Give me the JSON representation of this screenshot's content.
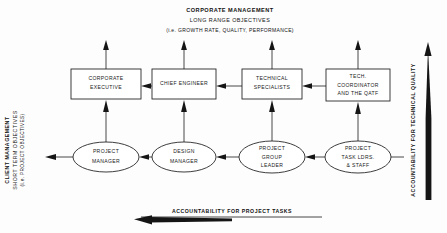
{
  "diagram": {
    "title_block": {
      "line1": "CORPORATE MANAGEMENT",
      "line2": "LONG RANGE OBJECTIVES",
      "line3": "(i.e. GROWTH RATE, QUALITY, PERFORMANCE)"
    },
    "left_axis": {
      "line1": "CLIENT MANAGEMENT",
      "line2": "SHORT TERM OBJECTIVES",
      "line3": "(i.e. PROJECT OBJECTIVES)"
    },
    "right_axis": {
      "label": "ACCOUNTABILITY FOR TECHNICAL QUALITY",
      "arrow_direction": "up"
    },
    "bottom_axis": {
      "label": "ACCOUNTABILITY FOR PROJECT TASKS",
      "arrow_direction": "left"
    },
    "top_row": {
      "shape": "rectangle",
      "nodes": [
        {
          "id": "corporate-executive",
          "lines": [
            "CORPORATE",
            "EXECUTIVE"
          ]
        },
        {
          "id": "chief-engineer",
          "lines": [
            "CHIEF ENGINEER"
          ]
        },
        {
          "id": "technical-specialists",
          "lines": [
            "TECHNICAL",
            "SPECIALISTS"
          ]
        },
        {
          "id": "tech-coordinator",
          "lines": [
            "TECH.",
            "COORDINATOR",
            "AND THE QATF"
          ]
        }
      ]
    },
    "bottom_row": {
      "shape": "ellipse",
      "nodes": [
        {
          "id": "project-manager",
          "lines": [
            "PROJECT",
            "MANAGER"
          ]
        },
        {
          "id": "design-manager",
          "lines": [
            "DESIGN",
            "MANAGER"
          ]
        },
        {
          "id": "project-group-leader",
          "lines": [
            "PROJECT",
            "GROUP",
            "LEADER"
          ]
        },
        {
          "id": "project-task-leaders",
          "lines": [
            "PROJECT",
            "TASK LDRS.",
            "& STAFF"
          ]
        }
      ]
    },
    "colors": {
      "stroke": "#1b1b1b",
      "background": "#fdfdfd",
      "text": "#121212"
    }
  }
}
